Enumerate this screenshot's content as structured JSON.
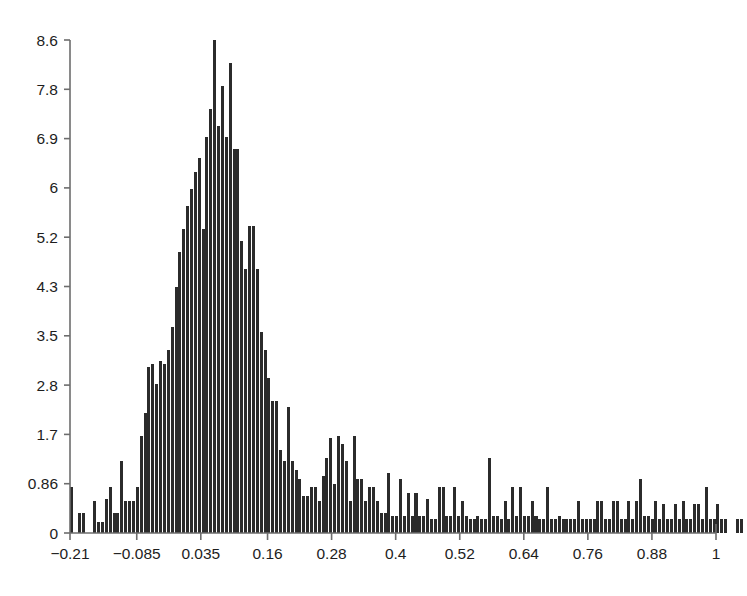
{
  "chart_data": {
    "type": "bar",
    "title": "",
    "subtitle": "",
    "xlabel": "",
    "ylabel": "",
    "legend": [],
    "grid": false,
    "annotations": [],
    "xlim": [
      -0.21,
      1.0
    ],
    "ylim": [
      0,
      8.6
    ],
    "x_tick_labels": [
      "-0.21",
      "-0.085",
      "0.035",
      "0.16",
      "0.28",
      "0.4",
      "0.52",
      "0.64",
      "0.76",
      "0.88",
      "1"
    ],
    "x_tick_values": [
      -0.21,
      -0.085,
      0.035,
      0.16,
      0.28,
      0.4,
      0.52,
      0.64,
      0.76,
      0.88,
      1.0
    ],
    "y_tick_labels": [
      "0",
      "0.86",
      "1.7",
      "2.8",
      "3.5",
      "4.3",
      "5.2",
      "6",
      "6.9",
      "7.8",
      "8.6"
    ],
    "y_tick_values": [
      0,
      0.86,
      1.72,
      2.58,
      3.44,
      4.3,
      5.16,
      6.02,
      6.88,
      7.74,
      8.6
    ],
    "bar_color": "#2b2b2b",
    "axis_color": "#6d6d6d",
    "background_color": "#ffffff",
    "bin_width": 0.00725,
    "bin_start": -0.21,
    "values": [
      0.8,
      0.0,
      0.35,
      0.35,
      0.0,
      0.0,
      0.55,
      0.2,
      0.2,
      0.6,
      0.8,
      0.35,
      0.35,
      1.25,
      0.55,
      0.55,
      0.55,
      0.8,
      1.7,
      2.1,
      2.9,
      2.95,
      2.6,
      3.0,
      2.95,
      3.2,
      3.6,
      4.3,
      4.9,
      5.3,
      5.7,
      6.0,
      6.3,
      6.55,
      5.3,
      6.9,
      7.4,
      8.6,
      7.1,
      7.8,
      6.9,
      8.2,
      6.7,
      6.7,
      5.1,
      4.6,
      5.35,
      5.35,
      4.6,
      3.5,
      3.2,
      2.7,
      2.3,
      2.3,
      1.45,
      1.25,
      2.2,
      1.25,
      1.1,
      0.95,
      0.65,
      0.65,
      0.8,
      0.8,
      0.55,
      1.0,
      1.3,
      1.65,
      0.85,
      1.7,
      1.55,
      1.25,
      0.55,
      1.7,
      0.95,
      0.95,
      0.55,
      0.8,
      0.8,
      0.55,
      0.35,
      0.35,
      1.05,
      0.3,
      0.3,
      0.95,
      0.3,
      0.7,
      0.3,
      0.7,
      0.3,
      0.3,
      0.6,
      0.25,
      0.25,
      0.8,
      0.8,
      0.3,
      0.3,
      0.8,
      0.3,
      0.55,
      0.3,
      0.25,
      0.25,
      0.3,
      0.25,
      0.25,
      1.3,
      0.3,
      0.3,
      0.25,
      0.55,
      0.25,
      0.8,
      0.3,
      0.8,
      0.3,
      0.3,
      0.55,
      0.3,
      0.25,
      0.25,
      0.8,
      0.25,
      0.25,
      0.3,
      0.25,
      0.25,
      0.25,
      0.25,
      0.55,
      0.25,
      0.25,
      0.25,
      0.25,
      0.55,
      0.55,
      0.25,
      0.25,
      0.55,
      0.55,
      0.25,
      0.25,
      0.55,
      0.25,
      0.55,
      0.95,
      0.3,
      0.3,
      0.25,
      0.55,
      0.25,
      0.5,
      0.25,
      0.25,
      0.5,
      0.25,
      0.55,
      0.25,
      0.25,
      0.5,
      0.5,
      0.25,
      0.8,
      0.25,
      0.25,
      0.5,
      0.25,
      0.25,
      0.0,
      0.0,
      0.25,
      0.25,
      0.0,
      0.0,
      0.0,
      0.0,
      0.0,
      0.0
    ]
  },
  "figure": {
    "plot_left_px": 70,
    "plot_right_px": 716,
    "plot_bottom_px": 533,
    "plot_top_px": 40
  }
}
